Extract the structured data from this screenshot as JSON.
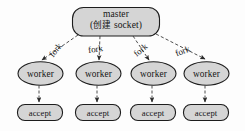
{
  "diagram": {
    "type": "process-fork-flow",
    "title_text": "master / worker fork model",
    "colors": {
      "node_fill": "#d5d5d5",
      "node_stroke": "#1d1d1d",
      "edge_stroke": "#3a3a3a",
      "text": "#141414",
      "background": "#fdfdfd"
    },
    "master": {
      "line1": "master",
      "line2_prefix": "(",
      "line2_cjk": "创建",
      "line2_suffix": " socket)",
      "shape": "rounded-rectangle"
    },
    "edge_label": "fork",
    "edges": [
      {
        "label": "fork",
        "from": "master",
        "to": "worker-1",
        "style": "dashed"
      },
      {
        "label": "fork",
        "from": "master",
        "to": "worker-2",
        "style": "dashed"
      },
      {
        "label": "fork",
        "from": "master",
        "to": "worker-3",
        "style": "dashed"
      },
      {
        "label": "fork",
        "from": "master",
        "to": "worker-4",
        "style": "dashed"
      }
    ],
    "workers": [
      {
        "label": "worker",
        "shape": "ellipse",
        "child": {
          "label": "accept",
          "shape": "rounded-rectangle"
        }
      },
      {
        "label": "worker",
        "shape": "ellipse",
        "child": {
          "label": "accept",
          "shape": "rounded-rectangle"
        }
      },
      {
        "label": "worker",
        "shape": "ellipse",
        "child": {
          "label": "accept",
          "shape": "rounded-rectangle"
        }
      },
      {
        "label": "worker",
        "shape": "ellipse",
        "child": {
          "label": "accept",
          "shape": "rounded-rectangle"
        }
      }
    ]
  }
}
